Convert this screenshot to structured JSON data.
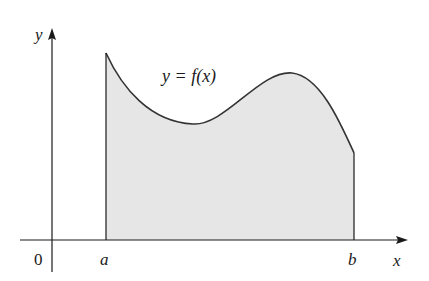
{
  "figure": {
    "curve_label": "y = f(x)",
    "axes": {
      "x_label": "x",
      "y_label": "y",
      "origin_label": "0"
    },
    "bounds": {
      "lower_label": "a",
      "upper_label": "b"
    },
    "colors": {
      "fill": "#e6e6e6",
      "stroke": "#333333",
      "axis": "#1a1a1a"
    }
  }
}
